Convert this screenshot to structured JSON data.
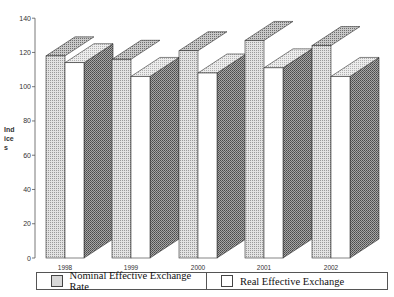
{
  "chart_data": {
    "type": "bar",
    "style": "3d-clustered-column",
    "title": "",
    "xlabel": "",
    "ylabel": "Indices",
    "ylabel_display": "Ind ice s",
    "ylim": [
      0,
      140
    ],
    "yticks": [
      0,
      20,
      40,
      60,
      80,
      100,
      120,
      140
    ],
    "categories": [
      "1998",
      "1999",
      "2000",
      "2001",
      "2002"
    ],
    "series": [
      {
        "name": "Nominal Effective Exchange Rate",
        "values": [
          118,
          116,
          121,
          127,
          124
        ],
        "fill": "dotted-gray"
      },
      {
        "name": "Real Effective Exchange",
        "values": [
          114,
          106,
          108,
          111,
          106
        ],
        "fill": "white"
      }
    ],
    "grid": false,
    "legend_position": "bottom"
  },
  "legend": {
    "nominal_label": "Nominal Effective Exchange Rate",
    "real_label": "Real Effective Exchange"
  },
  "axis": {
    "ylabel_text": "Ind ice s"
  },
  "colors": {
    "nominal_front": "#d6d6d6",
    "nominal_top": "#b5b5b5",
    "side": "#8c8c8c",
    "real_front": "#ffffff",
    "real_top": "#e4e4e4",
    "outline": "#333333"
  }
}
